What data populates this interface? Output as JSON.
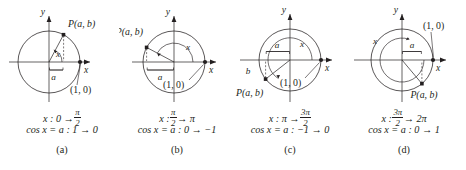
{
  "figure": {
    "type": "math-diagram-set",
    "ink_color": "#231f20",
    "background_color": "#ffffff"
  },
  "panels": [
    {
      "id": "a",
      "label": "(a)",
      "axis_y_label": "y",
      "axis_x_label": "x",
      "point_label": "P(a, b)",
      "unit_point_label": "(1, 0)",
      "arc_label": "x",
      "brace_label": "a",
      "vertical_label": "b",
      "show_vertical_label": false,
      "range_text": "x : 0 → π/2",
      "range_prefix": "x : 0 →",
      "range_frac_num": "π",
      "range_frac_den": "2",
      "cos_text": "cos x = a : 1 → 0",
      "angle_start_deg": 0,
      "angle_end_deg": 90,
      "point_angle_deg": 62,
      "cos_start": "1",
      "cos_end": "0"
    },
    {
      "id": "b",
      "label": "(b)",
      "axis_y_label": "y",
      "axis_x_label": "x",
      "point_label": "P(a, b)",
      "unit_point_label": "(1, 0)",
      "arc_label": "x",
      "brace_label": "a",
      "vertical_label": "b",
      "show_vertical_label": false,
      "range_text": "x : π/2 → π",
      "range_prefix": "x :",
      "range_frac_num": "π",
      "range_frac_den": "2",
      "range_suffix": "→ π",
      "cos_text": "cos x = a : 0 → −1",
      "angle_start_deg": 0,
      "angle_end_deg": 152,
      "point_angle_deg": 152,
      "cos_start": "0",
      "cos_end": "−1"
    },
    {
      "id": "c",
      "label": "(c)",
      "axis_y_label": "y",
      "axis_x_label": "x",
      "point_label": "P(a, b)",
      "unit_point_label": "(1, 0)",
      "arc_label": "x",
      "brace_label": "a",
      "vertical_label": "b",
      "show_vertical_label": true,
      "range_text": "x : π → 3π/2",
      "range_prefix": "x : π →",
      "range_frac_num": "3π",
      "range_frac_den": "2",
      "cos_text": "cos x = a : −1 → 0",
      "angle_start_deg": 0,
      "angle_end_deg": 218,
      "point_angle_deg": 218,
      "cos_start": "−1",
      "cos_end": "0"
    },
    {
      "id": "d",
      "label": "(d)",
      "axis_y_label": "y",
      "axis_x_label": "x",
      "point_label": "P(a, b)",
      "unit_point_label": "(1, 0)",
      "arc_label": "x",
      "brace_label": "a",
      "vertical_label": "b",
      "show_vertical_label": false,
      "range_text": "x : 3π/2 → 2π",
      "range_prefix": "x :",
      "range_frac_num": "3π",
      "range_frac_den": "2",
      "range_suffix": "→ 2π",
      "cos_text": "cos x = a : 0 → 1",
      "angle_start_deg": 0,
      "angle_end_deg": 310,
      "point_angle_deg": 310,
      "cos_start": "0",
      "cos_end": "1"
    }
  ]
}
